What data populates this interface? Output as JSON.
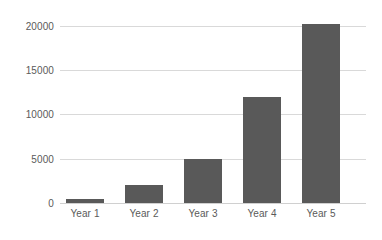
{
  "chart_data": {
    "type": "bar",
    "title": "",
    "subtitle": "",
    "xlabel": "",
    "ylabel": "",
    "categories": [
      "Year 1",
      "Year 2",
      "Year 3",
      "Year 4",
      "Year 5"
    ],
    "values": [
      450,
      2000,
      5000,
      12000,
      20200
    ],
    "series": [
      {
        "name": "",
        "values": [
          450,
          2000,
          5000,
          12000,
          20200
        ]
      }
    ],
    "ylim": [
      0,
      20000
    ],
    "xlim": null,
    "y_ticks": [
      0,
      5000,
      10000,
      15000,
      20000
    ],
    "y_tick_labels": [
      "0",
      "5000",
      "10000",
      "15000",
      "20000"
    ],
    "x_tick_labels": [
      "Year 1",
      "Year 2",
      "Year 3",
      "Year 4",
      "Year 5"
    ],
    "grid": {
      "horizontal": true,
      "vertical": false
    },
    "legend": {
      "visible": false,
      "position": "none",
      "entries": []
    },
    "colors": {
      "bar": "#595959",
      "gridline": "#d9d9d9",
      "axis": "#d0d0d0",
      "tick_label": "#5a5a5a",
      "background": "#ffffff"
    },
    "annotations": [],
    "data_labels_visible": false
  }
}
